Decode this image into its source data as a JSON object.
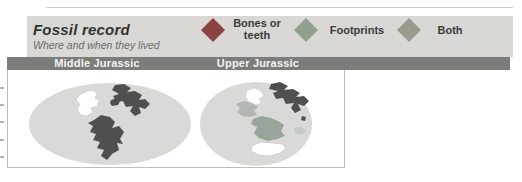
{
  "figure": {
    "title": "Fossil record",
    "subtitle": "Where and when they lived"
  },
  "legend": {
    "strip_bg": "#d9d8d4",
    "items": [
      {
        "label": "Bones or\nteeth",
        "color": "#8c4143",
        "icon": "diamond"
      },
      {
        "label": "Footprints",
        "color": "#8f9f90",
        "icon": "diamond"
      },
      {
        "label": "Both",
        "color": "#9c9a8d",
        "icon": "diamond"
      }
    ]
  },
  "period_bar": {
    "bg": "#7c7c7a",
    "text_color": "#f5f5f3",
    "labels": [
      "Middle Jurassic",
      "Upper Jurassic"
    ]
  },
  "map_colors": {
    "ocean": "#d9d9d7",
    "dark_land": "#4f4f4d",
    "white_land": "#ffffff",
    "green_land": "#9aa59a",
    "gray_land": "#b3b7b3",
    "light_land": "#c5c9c5",
    "land_outline": "#c2c2c0"
  }
}
